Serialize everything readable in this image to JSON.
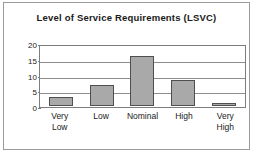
{
  "chart_data": {
    "type": "bar",
    "title": "Level of Service Requirements (LSVC)",
    "xlabel": "",
    "ylabel": "",
    "categories": [
      "Very Low",
      "Low",
      "Nominal",
      "High",
      "Very High"
    ],
    "category_lines": [
      [
        "Very",
        "Low"
      ],
      [
        "Low"
      ],
      [
        "Nominal"
      ],
      [
        "High"
      ],
      [
        "Very",
        "High"
      ]
    ],
    "values": [
      3,
      7,
      16.5,
      8.5,
      1
    ],
    "ylim": [
      0,
      20
    ],
    "yticks": [
      0,
      5,
      10,
      15,
      20
    ],
    "ytick_labels": [
      "0",
      "5",
      "10",
      "15",
      "20"
    ],
    "grid": true,
    "legend": false,
    "bar_fill_color": "#a9a9a9",
    "bar_border_color": "#4f4f4f",
    "axis_color": "#7d7d7d",
    "gridline_color": "#8d8d8d",
    "frame_color": "#9a9a9a",
    "text_color": "#1a1a1a",
    "background_color": "#ffffff"
  }
}
